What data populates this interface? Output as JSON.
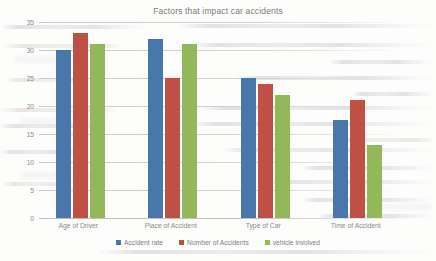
{
  "chart_data": {
    "type": "bar",
    "title": "Factors that impact car accidents",
    "xlabel": "",
    "ylabel": "",
    "ylim": [
      0,
      35
    ],
    "ytick_step": 5,
    "yticks": [
      "0",
      "5",
      "10",
      "15",
      "20",
      "25",
      "30",
      "35"
    ],
    "grid": true,
    "legend_position": "bottom",
    "categories": [
      "Age of Driver",
      "Place of Accident",
      "Type of Car",
      "Time of Accident"
    ],
    "series": [
      {
        "name": "Accident rate",
        "color": "#4a77ab",
        "values": [
          30,
          32,
          25,
          17.5
        ]
      },
      {
        "name": "Number of Accidents",
        "color": "#bf5045",
        "values": [
          33,
          25,
          24,
          21
        ]
      },
      {
        "name": "vehicle involved",
        "color": "#93b85a",
        "values": [
          31,
          31,
          22,
          13
        ]
      }
    ]
  },
  "legend": {
    "entries": [
      {
        "label": "Accident rate",
        "swatch": "legend-swatch-blue"
      },
      {
        "label": "Number of Accidents",
        "swatch": "legend-swatch-red"
      },
      {
        "label": "vehicle involved",
        "swatch": "legend-swatch-green"
      }
    ]
  }
}
